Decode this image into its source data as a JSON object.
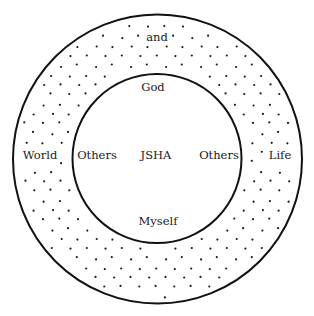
{
  "diagram": {
    "type": "concentric-circles",
    "outer_ring": {
      "fill": "dotted",
      "labels": {
        "top": "and",
        "left": "World",
        "right": "Life"
      }
    },
    "inner_circle": {
      "labels": {
        "top": "God",
        "left": "Others",
        "center": "JSHA",
        "right": "Others",
        "bottom": "Myself"
      }
    },
    "colors": {
      "stroke": "#111111",
      "dots": "#1a1a1a",
      "background": "#ffffff"
    }
  }
}
